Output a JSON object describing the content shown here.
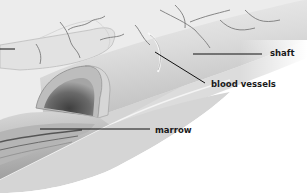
{
  "diagram": {
    "labels": [
      {
        "id": "shaft",
        "text": "shaft"
      },
      {
        "id": "blood_vessels",
        "text": "blood vessels"
      },
      {
        "id": "marrow",
        "text": "marrow"
      }
    ],
    "colors": {
      "background": "#ffffff",
      "bone_light": "#e8e8e8",
      "bone_mid": "#cfcfcf",
      "bone_dark": "#8a8a8a",
      "marrow_dark": "#5a5a5a",
      "vessel": "#7a7a7a",
      "leader_line": "#111111",
      "label_text": "#1a1a1a"
    }
  }
}
